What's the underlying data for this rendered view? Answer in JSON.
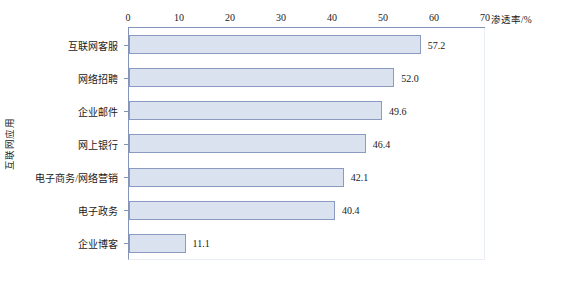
{
  "chart_data": {
    "type": "bar",
    "orientation": "horizontal",
    "title": "",
    "xlabel": "渗透率/%",
    "ylabel": "互联网应用",
    "xlim": [
      0,
      70
    ],
    "xticks": [
      0,
      10,
      20,
      30,
      40,
      50,
      60,
      70
    ],
    "grid": false,
    "legend": null,
    "categories": [
      "互联网客服",
      "网络招聘",
      "企业邮件",
      "网上银行",
      "电子商务/网络营销",
      "电子政务",
      "企业博客"
    ],
    "values": [
      57.2,
      52.0,
      49.6,
      46.4,
      42.1,
      40.4,
      11.1
    ],
    "value_labels": [
      "57.2",
      "52.0",
      "49.6",
      "46.4",
      "42.1",
      "40.4",
      "11.1"
    ],
    "bar_fill_color": "#dae2f0",
    "bar_border_color": "#8a9ac0",
    "axis_color": "#8494b8"
  }
}
